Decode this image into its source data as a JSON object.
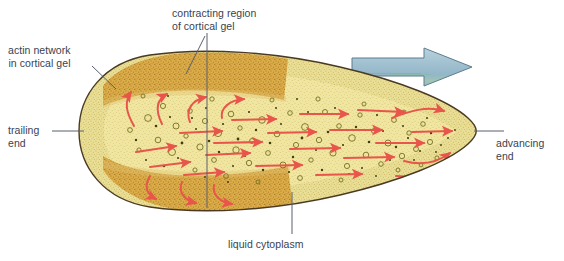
{
  "figure": {
    "width": 564,
    "height": 261,
    "background": "#ffffff"
  },
  "labels": {
    "actin_network": "actin network\nin cortical gel",
    "trailing_end": "trailing\nend",
    "contracting_region": "contracting region\nof cortical gel",
    "liquid_cytoplasm": "liquid cytoplasm",
    "advancing_end": "advancing\nend"
  },
  "colors": {
    "text": "#3a3f4f",
    "leader_line": "#5a5f6e",
    "cell_outline": "#4a3a22",
    "cytoplasm_light": "#f2e8a8",
    "cytoplasm_mid": "#ece08c",
    "cortical_gel_light": "#e3d288",
    "cortical_gel_dark": "#d9a63c",
    "cortical_gel_dark2": "#cf9b33",
    "vesicle_outline": "#6f6a1e",
    "granule": "#413d10",
    "flow_arrow": "#e8554a",
    "motion_arrow_fill": "#a3c2d2",
    "motion_arrow_stroke": "#5d7d8c",
    "motion_arrow_accent": "#8fb8a8"
  },
  "motion_arrow": {
    "name": "direction-of-movement-arrow",
    "direction": "right",
    "x": 352,
    "y": 48,
    "width": 120,
    "height": 38
  },
  "regions": [
    {
      "name": "upper-contracting-cortical-gel",
      "description": "darker golden stippled band along dorsal surface"
    },
    {
      "name": "lower-contracting-cortical-gel",
      "description": "darker golden stippled band along ventral surface"
    },
    {
      "name": "cortical-gel-rim",
      "description": "pale stippled rim of actin network around whole cell"
    },
    {
      "name": "liquid-cytoplasm-core",
      "description": "pale yellow interior with vesicles and granules"
    }
  ],
  "flow_arrows": {
    "count": 24,
    "color": "#e8554a",
    "description": "red arrows showing cytoplasmic streaming forward to the advancing end and returning into the cortical gel at the trailing end"
  }
}
